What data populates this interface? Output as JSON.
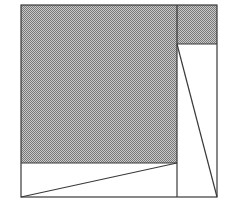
{
  "figure": {
    "canvas": {
      "width": 225,
      "height": 210,
      "background_color": "#ffffff"
    },
    "style": {
      "line_color": "#3a3a3a",
      "line_width": 1.2,
      "shade_color": "#9e9e9e",
      "shade_pattern": "dither-50-percent",
      "shade_dot_color": "#767676",
      "fill_color": "#ffffff"
    },
    "outer_rectangle": {
      "label": "outer boundary",
      "x": 21,
      "y": 5,
      "width": 196,
      "height": 192,
      "corners": {
        "top_left": [
          21,
          5
        ],
        "top_right": [
          217,
          5
        ],
        "bottom_right": [
          217,
          197
        ],
        "bottom_left": [
          21,
          197
        ]
      }
    },
    "divider_vertical": {
      "label": "vertical divider",
      "x": 177,
      "y1": 5,
      "y2": 197
    },
    "divider_horizontal_right": {
      "label": "horizontal divider in right column",
      "y": 44,
      "x1": 177,
      "x2": 217
    },
    "divider_horizontal_left": {
      "label": "horizontal divider in left column",
      "y": 163,
      "x1": 21,
      "x2": 177
    },
    "regions": [
      {
        "name": "left-shaded-rectangle",
        "kind": "rectangle",
        "shaded": true,
        "points": [
          [
            21,
            5
          ],
          [
            177,
            5
          ],
          [
            177,
            163
          ],
          [
            21,
            163
          ]
        ]
      },
      {
        "name": "top-right-shaded-rectangle",
        "kind": "rectangle",
        "shaded": true,
        "points": [
          [
            177,
            5
          ],
          [
            217,
            5
          ],
          [
            217,
            44
          ],
          [
            177,
            44
          ]
        ]
      },
      {
        "name": "bottom-left-white-triangle",
        "kind": "triangle",
        "shaded": false,
        "points": [
          [
            21,
            197
          ],
          [
            177,
            163
          ],
          [
            177,
            197
          ]
        ]
      },
      {
        "name": "bottom-left-white-upper-triangle",
        "kind": "triangle",
        "shaded": false,
        "points": [
          [
            21,
            163
          ],
          [
            177,
            163
          ],
          [
            21,
            197
          ]
        ]
      },
      {
        "name": "right-white-lower-triangle",
        "kind": "triangle",
        "shaded": false,
        "points": [
          [
            177,
            44
          ],
          [
            217,
            197
          ],
          [
            177,
            197
          ]
        ]
      },
      {
        "name": "right-white-upper-triangle",
        "kind": "triangle",
        "shaded": false,
        "points": [
          [
            177,
            44
          ],
          [
            217,
            44
          ],
          [
            217,
            197
          ]
        ]
      }
    ],
    "diagonals": [
      {
        "name": "lower-left-diagonal",
        "from": [
          21,
          197
        ],
        "to": [
          177,
          163
        ]
      },
      {
        "name": "right-column-diagonal",
        "from": [
          177,
          44
        ],
        "to": [
          217,
          197
        ]
      }
    ]
  }
}
